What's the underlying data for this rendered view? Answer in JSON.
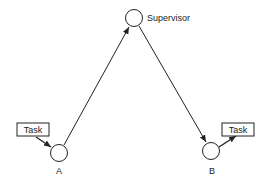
{
  "diagram": {
    "nodes": {
      "supervisor": {
        "label": "Supervisor",
        "cx": 134,
        "cy": 18,
        "r": 8.5
      },
      "a": {
        "label": "A",
        "cx": 59,
        "cy": 153,
        "r": 8.5
      },
      "b": {
        "label": "B",
        "cx": 211,
        "cy": 151,
        "r": 8.5
      }
    },
    "tasks": {
      "left": {
        "label": "Task"
      },
      "right": {
        "label": "Task"
      }
    },
    "edges": [
      {
        "from": "a",
        "to": "supervisor"
      },
      {
        "from": "supervisor",
        "to": "b"
      },
      {
        "from": "task-left",
        "to": "a"
      },
      {
        "from": "b",
        "to": "task-right"
      }
    ],
    "colors": {
      "stroke": "#222222",
      "background": "#ffffff"
    }
  }
}
